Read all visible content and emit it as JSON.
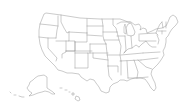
{
  "map": {
    "type": "choropleth-outline",
    "region": "United States",
    "projection": "Albers USA (with Alaska and Hawaii insets)",
    "style": {
      "background": "#ffffff",
      "fill": "#ffffff",
      "stroke": "#8a8a8a"
    },
    "labels": [],
    "insets": [
      "Alaska",
      "Hawaii"
    ],
    "states_shown": 50
  }
}
